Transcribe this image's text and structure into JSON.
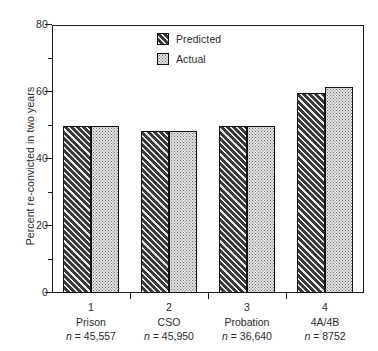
{
  "chart_data": {
    "type": "bar",
    "title": "",
    "xlabel": "",
    "ylabel": "Percent re-convicted in two years",
    "ylim": [
      0,
      80
    ],
    "yticks": [
      0,
      20,
      40,
      60,
      80
    ],
    "yminorticks": [
      10,
      30,
      50,
      70
    ],
    "grid": false,
    "legend_position": "top-center",
    "categories": [
      "Prison",
      "CSO",
      "Probation",
      "4A/4B"
    ],
    "category_numbers": [
      "1",
      "2",
      "3",
      "4"
    ],
    "category_n": [
      "n = 45,557",
      "n = 45,950",
      "n = 36,640",
      "n = 8752"
    ],
    "series": [
      {
        "name": "Predicted",
        "values": [
          50,
          48.5,
          50,
          59.7
        ]
      },
      {
        "name": "Actual",
        "values": [
          50,
          48.5,
          50,
          61.5
        ]
      }
    ]
  },
  "axes": {
    "y_title": "Percent re-convicted in two years",
    "y_ticks": [
      {
        "value": 80,
        "label": "80"
      },
      {
        "value": 60,
        "label": "60"
      },
      {
        "value": 40,
        "label": "40"
      },
      {
        "value": 20,
        "label": "20"
      },
      {
        "value": 0,
        "label": "0"
      }
    ]
  },
  "legend": {
    "items": [
      {
        "label": "Predicted",
        "pattern": "diagonal-hatch",
        "color": "#3a3a3a"
      },
      {
        "label": "Actual",
        "pattern": "dotted-stipple",
        "color": "#e4e4e4"
      }
    ]
  },
  "groups": [
    {
      "number": "1",
      "name": "Prison",
      "n": "n = 45,557",
      "predicted": 50,
      "actual": 50
    },
    {
      "number": "2",
      "name": "CSO",
      "n": "n = 45,950",
      "predicted": 48.5,
      "actual": 48.5
    },
    {
      "number": "3",
      "name": "Probation",
      "n": "n = 36,640",
      "predicted": 50,
      "actual": 50
    },
    {
      "number": "4",
      "name": "4A/4B",
      "n": "n = 8752",
      "predicted": 59.7,
      "actual": 61.5
    }
  ],
  "colors": {
    "predicted_fill": "#3a3a3a",
    "actual_fill": "#e4e4e4",
    "axis": "#1a1a1a",
    "text": "#2b2b2b",
    "background": "#ffffff"
  }
}
